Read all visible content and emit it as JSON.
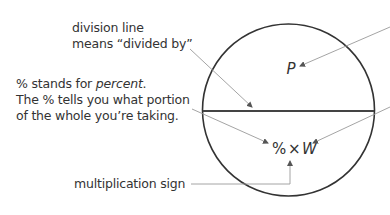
{
  "labels": {
    "division": {
      "line1": "division line",
      "line2": "means “divided by”"
    },
    "percent": {
      "line1_prefix": "% stands for ",
      "line1_em": "percent",
      "line1_suffix": ".",
      "line2": "The % tells you what portion",
      "line3": "of the whole you’re taking."
    },
    "multiplication": "multiplication sign"
  },
  "circle": {
    "top_symbol": "P",
    "bottom_percent": "%",
    "bottom_times": "×",
    "bottom_whole": "W"
  },
  "colors": {
    "circle_stroke": "#333333",
    "arrow_stroke": "#9a9a9a",
    "text": "#333333"
  }
}
